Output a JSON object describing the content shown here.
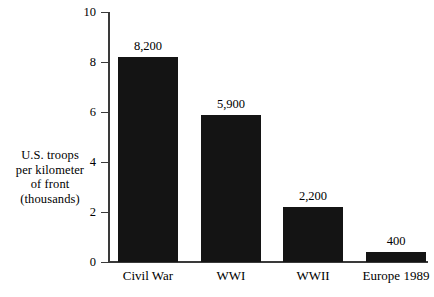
{
  "chart_data": {
    "type": "bar",
    "title": "",
    "xlabel": "",
    "ylabel": "U.S. troops per kilometer of front (thousands)",
    "categories": [
      "Civil War",
      "WWI",
      "WWII",
      "Europe 1989"
    ],
    "values": [
      8.2,
      5.9,
      2.2,
      0.4
    ],
    "value_labels": [
      "8,200",
      "5,900",
      "2,200",
      "400"
    ],
    "units": "troops per kilometer of front",
    "ylim": [
      0,
      10
    ],
    "yticks": [
      0,
      2,
      4,
      6,
      8,
      10
    ],
    "ytick_labels": [
      "0",
      "2",
      "4",
      "6",
      "8",
      "10"
    ],
    "grid": false,
    "legend": false,
    "bar_color": "#141414",
    "axis_color": "#3a3a3a",
    "background_color": "#ffffff"
  },
  "axis_caption": {
    "line1": "U.S. troops",
    "line2": "per kilometer",
    "line3": "of front",
    "line4": "(thousands)"
  }
}
